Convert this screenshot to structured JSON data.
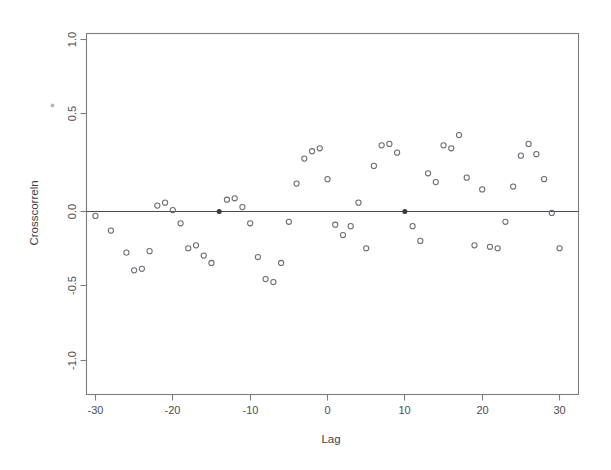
{
  "chart_data": {
    "type": "scatter",
    "title": "",
    "xlabel": "Lag",
    "ylabel": "Crosscorreln",
    "xlim": [
      -33,
      34
    ],
    "ylim": [
      -1.15,
      1.12
    ],
    "xticks": [
      -30,
      -20,
      -10,
      0,
      10,
      20,
      30
    ],
    "xticklabels": [
      "-30",
      "-20",
      "-10",
      "0",
      "10",
      "20",
      "30"
    ],
    "yticks": [
      -1.0,
      -0.5,
      0.0,
      0.5,
      1.0
    ],
    "yticklabels": [
      "-1.0",
      "-0.5",
      "0.0",
      "0.5",
      "1.0"
    ],
    "grid": false,
    "legend": null,
    "reference_lines": [
      {
        "orientation": "horizontal",
        "value": 0.0
      }
    ],
    "marker": "open-circle",
    "x": [
      -30,
      -28,
      -26,
      -25,
      -24,
      -23,
      -22,
      -21,
      -20,
      -19,
      -18,
      -17,
      -16,
      -15,
      -14,
      -13,
      -12,
      -11,
      -10,
      -9,
      -8,
      -7,
      -6,
      -5,
      -4,
      -3,
      -2,
      -1,
      0,
      1,
      2,
      3,
      4,
      5,
      6,
      7,
      8,
      9,
      10,
      11,
      12,
      13,
      14,
      15,
      16,
      17,
      18,
      19,
      20,
      21,
      22,
      23,
      24,
      25,
      26,
      27,
      28,
      29,
      30
    ],
    "y": [
      -0.03,
      -0.13,
      -0.28,
      -0.4,
      -0.39,
      -0.27,
      0.04,
      0.06,
      0.01,
      -0.08,
      -0.25,
      -0.23,
      -0.3,
      -0.35,
      0.0,
      0.08,
      0.09,
      0.03,
      -0.08,
      -0.31,
      -0.46,
      -0.48,
      -0.35,
      -0.07,
      0.19,
      0.36,
      0.41,
      0.43,
      0.22,
      -0.09,
      -0.16,
      -0.1,
      0.06,
      -0.25,
      0.31,
      0.45,
      0.46,
      0.4,
      0.0,
      -0.1,
      -0.2,
      0.26,
      0.2,
      0.45,
      0.43,
      0.52,
      0.23,
      -0.23,
      0.15,
      -0.24,
      -0.25,
      -0.07,
      0.17,
      0.38,
      0.46,
      0.39,
      0.22,
      -0.01,
      -0.25
    ],
    "highlighted_points": [
      {
        "x": -23,
        "y": 0.0
      },
      {
        "x": -14,
        "y": 0.0
      },
      {
        "x": 10,
        "y": 0.0
      },
      {
        "x": 30,
        "y": -0.01
      }
    ],
    "colors": {
      "marker_stroke": "#6b6b75",
      "highlight": "#3a3a44",
      "frame": "#7d7d82",
      "reference_line": "#4a4a4f",
      "background": "#ffffff"
    }
  }
}
